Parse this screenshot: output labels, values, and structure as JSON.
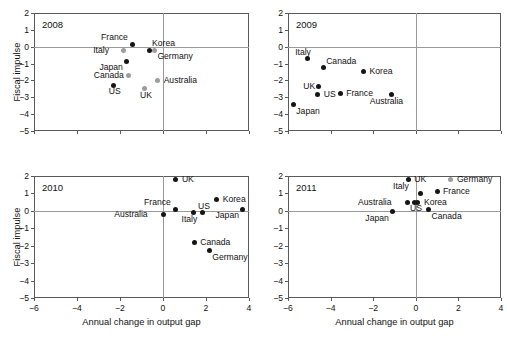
{
  "figure": {
    "xlabel": "Annual change in output gap",
    "ylabel": "Fiscal impulse",
    "xticks": [
      "-6",
      "-4",
      "-2",
      "0",
      "2",
      "4"
    ],
    "yticks": [
      "2",
      "1",
      "0",
      "-1",
      "-2",
      "-3",
      "-4",
      "-5"
    ],
    "colors": {
      "black": "#151515",
      "gray": "#9d9d9d",
      "frame": "#5a5a5a",
      "zeroline": "#9a9a9a"
    }
  },
  "chart_data": [
    {
      "type": "scatter",
      "title": "2008",
      "xlabel": "Annual change in output gap",
      "ylabel": "Fiscal impulse",
      "xlim": [
        -6,
        4
      ],
      "ylim": [
        -5,
        2
      ],
      "grid": false,
      "legend": "none",
      "points": [
        {
          "label": "France",
          "x": -1.4,
          "y": 0.15,
          "color": "black",
          "label_pos": "above-left"
        },
        {
          "label": "Korea",
          "x": -0.65,
          "y": -0.2,
          "color": "black",
          "label_pos": "above-right"
        },
        {
          "label": "Germany",
          "x": -0.4,
          "y": -0.2,
          "color": "gray",
          "label_pos": "below-right"
        },
        {
          "label": "Italy",
          "x": -1.85,
          "y": -0.22,
          "color": "gray",
          "label_pos": "left"
        },
        {
          "label": "Japan",
          "x": -1.7,
          "y": -0.85,
          "color": "black",
          "label_pos": "below-left"
        },
        {
          "label": "Canada",
          "x": -1.6,
          "y": -1.7,
          "color": "gray",
          "label_pos": "left"
        },
        {
          "label": "Australia",
          "x": -0.25,
          "y": -2.0,
          "color": "gray",
          "label_pos": "right"
        },
        {
          "label": "US",
          "x": -2.3,
          "y": -2.3,
          "color": "black",
          "label_pos": "below"
        },
        {
          "label": "UK",
          "x": -0.85,
          "y": -2.5,
          "color": "gray",
          "label_pos": "below"
        }
      ]
    },
    {
      "type": "scatter",
      "title": "2009",
      "xlabel": "Annual change in output gap",
      "ylabel": "Fiscal impulse",
      "xlim": [
        -6,
        4
      ],
      "ylim": [
        -5,
        2
      ],
      "grid": false,
      "legend": "none",
      "points": [
        {
          "label": "Italy",
          "x": -5.1,
          "y": -0.7,
          "color": "black",
          "label_pos": "above"
        },
        {
          "label": "Canada",
          "x": -4.35,
          "y": -1.25,
          "color": "black",
          "label_pos": "above-right"
        },
        {
          "label": "Korea",
          "x": -2.45,
          "y": -1.45,
          "color": "black",
          "label_pos": "right"
        },
        {
          "label": "UK",
          "x": -4.55,
          "y": -2.35,
          "color": "black",
          "label_pos": "left"
        },
        {
          "label": "US",
          "x": -4.6,
          "y": -2.85,
          "color": "black",
          "label_pos": "right"
        },
        {
          "label": "France",
          "x": -3.55,
          "y": -2.8,
          "color": "black",
          "label_pos": "right"
        },
        {
          "label": "Australia",
          "x": -1.15,
          "y": -2.85,
          "color": "black",
          "label_pos": "below"
        },
        {
          "label": "Japan",
          "x": -5.75,
          "y": -3.45,
          "color": "black",
          "label_pos": "below-right"
        }
      ]
    },
    {
      "type": "scatter",
      "title": "2010",
      "xlabel": "Annual change in output gap",
      "ylabel": "Fiscal impulse",
      "xlim": [
        -6,
        4
      ],
      "ylim": [
        -5,
        2
      ],
      "grid": false,
      "legend": "none",
      "points": [
        {
          "label": "UK",
          "x": 0.6,
          "y": 1.78,
          "color": "black",
          "label_pos": "right"
        },
        {
          "label": "Korea",
          "x": 2.5,
          "y": 0.68,
          "color": "black",
          "label_pos": "right"
        },
        {
          "label": "France",
          "x": 0.6,
          "y": 0.08,
          "color": "black",
          "label_pos": "above-left"
        },
        {
          "label": "US",
          "x": 1.85,
          "y": -0.1,
          "color": "black",
          "label_pos": "above"
        },
        {
          "label": "Italy",
          "x": 1.42,
          "y": -0.1,
          "color": "black",
          "label_pos": "below"
        },
        {
          "label": "Japan",
          "x": 3.7,
          "y": 0.08,
          "color": "black",
          "label_pos": "below-left"
        },
        {
          "label": "Australia",
          "x": 0.02,
          "y": -0.22,
          "color": "black",
          "label_pos": "left"
        },
        {
          "label": "Canada",
          "x": 1.45,
          "y": -1.8,
          "color": "black",
          "label_pos": "right"
        },
        {
          "label": "Germany",
          "x": 2.15,
          "y": -2.3,
          "color": "black",
          "label_pos": "below-right"
        }
      ]
    },
    {
      "type": "scatter",
      "title": "2011",
      "xlabel": "Annual change in output gap",
      "ylabel": "Fiscal impulse",
      "xlim": [
        -6,
        4
      ],
      "ylim": [
        -5,
        2
      ],
      "grid": false,
      "legend": "none",
      "points": [
        {
          "label": "Germany",
          "x": 1.65,
          "y": 1.82,
          "color": "gray",
          "label_pos": "right"
        },
        {
          "label": "UK",
          "x": -0.35,
          "y": 1.78,
          "color": "black",
          "label_pos": "right"
        },
        {
          "label": "France",
          "x": 1.0,
          "y": 1.12,
          "color": "black",
          "label_pos": "right"
        },
        {
          "label": "Italy",
          "x": 0.2,
          "y": 1.0,
          "color": "black",
          "label_pos": "above-left"
        },
        {
          "label": "Australia",
          "x": -0.4,
          "y": 0.5,
          "color": "black",
          "label_pos": "left"
        },
        {
          "label": "Korea",
          "x": 0.1,
          "y": 0.5,
          "color": "black",
          "label_pos": "right"
        },
        {
          "label": "US",
          "x": -0.05,
          "y": 0.48,
          "color": "black",
          "label_pos": "below"
        },
        {
          "label": "Canada",
          "x": 0.6,
          "y": 0.05,
          "color": "black",
          "label_pos": "below-right"
        },
        {
          "label": "Japan",
          "x": -1.1,
          "y": -0.05,
          "color": "black",
          "label_pos": "below-left"
        }
      ]
    }
  ]
}
